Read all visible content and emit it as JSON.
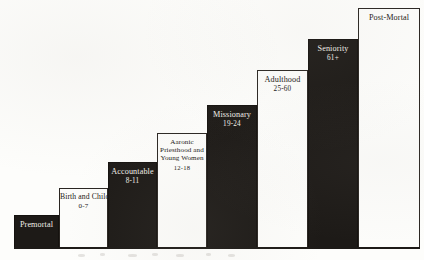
{
  "figure": {
    "background_color": "#fdfdfb",
    "bar_dark_color": "#1d1a17",
    "bar_light_color": "#fcfcfa",
    "outline_color": "#25211e"
  },
  "chart_data": {
    "type": "bar",
    "xlabel": "",
    "ylabel": "",
    "grid": false,
    "legend": null,
    "categories": [
      "Premortal",
      "Birth and Childhood",
      "Accountable",
      "Aaronic Priesthood and Young Women",
      "Missionary",
      "Adulthood",
      "Seniority",
      "Post-Mortal"
    ],
    "values": [
      33,
      60,
      86,
      115,
      143,
      178,
      209,
      240
    ],
    "ylim": [
      0,
      252
    ],
    "bars": [
      {
        "index": 0,
        "name": "Premortal",
        "range": "",
        "fill": "dark",
        "text_color": "#f2efe9",
        "x": 14,
        "width": 45,
        "top": 215,
        "height": 33
      },
      {
        "index": 1,
        "name": "Birth and Childhood",
        "range": "0-7",
        "fill": "light",
        "text_color": "#1a1714",
        "x": 59,
        "width": 49,
        "top": 188,
        "height": 60
      },
      {
        "index": 2,
        "name": "Accountable",
        "range": "8-11",
        "fill": "dark",
        "text_color": "#f2efe9",
        "x": 108,
        "width": 49,
        "top": 162,
        "height": 86
      },
      {
        "index": 3,
        "name": "Aaronic Priesthood and Young Women",
        "range": "12-18",
        "fill": "light",
        "text_color": "#1a1714",
        "x": 157,
        "width": 50,
        "top": 133,
        "height": 115
      },
      {
        "index": 4,
        "name": "Missionary",
        "range": "19-24",
        "fill": "dark",
        "text_color": "#f2efe9",
        "x": 207,
        "width": 50,
        "top": 105,
        "height": 143
      },
      {
        "index": 5,
        "name": "Adulthood",
        "range": "25-60",
        "fill": "light",
        "text_color": "#1a1714",
        "x": 257,
        "width": 51,
        "top": 70,
        "height": 178
      },
      {
        "index": 6,
        "name": "Seniority",
        "range": "61+",
        "fill": "dark",
        "text_color": "#f2efe9",
        "x": 308,
        "width": 50,
        "top": 39,
        "height": 209
      },
      {
        "index": 7,
        "name": "Post-Mortal",
        "range": "",
        "fill": "light",
        "text_color": "#1a1714",
        "x": 358,
        "width": 62,
        "top": 8,
        "height": 240
      }
    ],
    "baseline": {
      "x": 14,
      "y": 247,
      "width": 406,
      "thickness": 2
    }
  }
}
